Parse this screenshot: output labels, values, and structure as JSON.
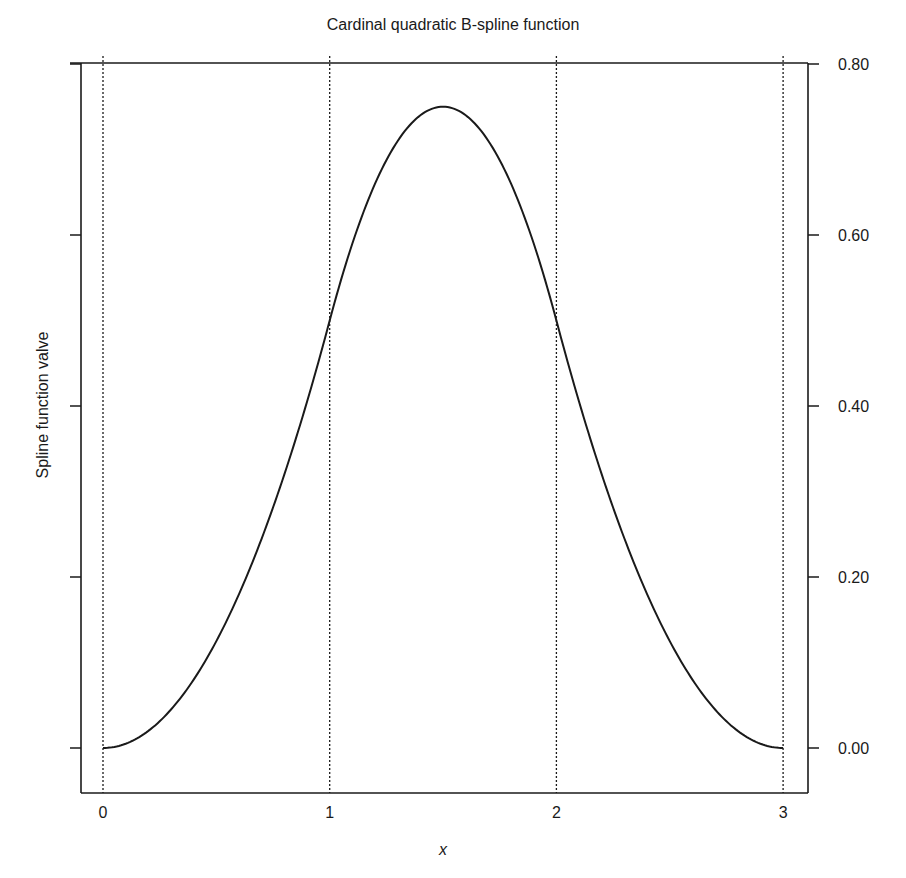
{
  "chart_data": {
    "type": "line",
    "title": "Cardinal quadratic B-spline function",
    "xlabel": "x",
    "ylabel": "Spline function valve",
    "xlim": [
      -0.1,
      3.1
    ],
    "ylim": [
      -0.06,
      0.805
    ],
    "x_ticks": [
      0,
      1,
      2,
      3
    ],
    "x_tick_labels": [
      "0",
      "1",
      "2",
      "3"
    ],
    "y_ticks": [
      0.0,
      0.2,
      0.4,
      0.6,
      0.8
    ],
    "y_tick_labels": [
      "0.00",
      "0.20",
      "0.40",
      "0.60",
      "0.80"
    ],
    "y_axis_label_side": "right",
    "grid": false,
    "knot_lines": [
      0,
      1,
      2,
      3
    ],
    "knot_line_style": "dotted",
    "legend": null,
    "series": [
      {
        "name": "B-spline",
        "description": "piecewise quadratic: x^2/2 on [0,1]; (-2x^2+6x-3)/2 on [1,2]; (3-x)^2/2 on [2,3]",
        "x": [
          0,
          0.25,
          0.5,
          0.75,
          1.0,
          1.25,
          1.5,
          1.75,
          2.0,
          2.25,
          2.5,
          2.75,
          3.0
        ],
        "y": [
          0.0,
          0.03125,
          0.125,
          0.28125,
          0.5,
          0.6875,
          0.75,
          0.6875,
          0.5,
          0.28125,
          0.125,
          0.03125,
          0.0
        ],
        "color": "#1a1a1a"
      }
    ]
  },
  "colors": {
    "line": "#1a1a1a",
    "axes": "#1a1a1a",
    "background": "#ffffff"
  }
}
